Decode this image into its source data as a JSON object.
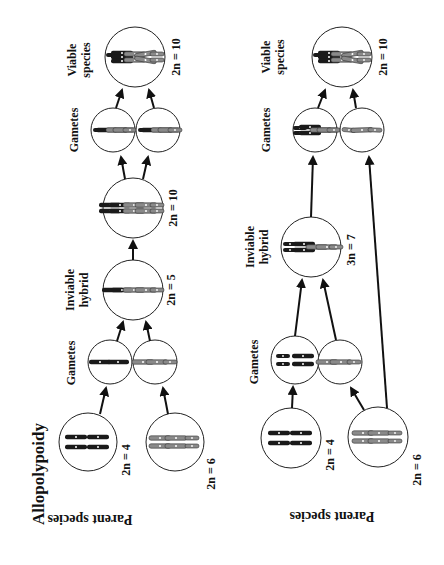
{
  "title": "Allopolypoidy",
  "colors": {
    "ink": "#111111",
    "species_a": "#1a1a1a",
    "species_b": "#8a8a8a",
    "background": "#ffffff"
  },
  "top_panel": {
    "parent_label": "Parent species",
    "parent_a": {
      "count": "2n = 4",
      "chromosome_color": "dark"
    },
    "parent_b": {
      "count": "2n = 6",
      "chromosome_color": "gray"
    },
    "gametes_label": "Gametes",
    "hybrid_label_1": "Inviable",
    "hybrid_label_2": "hybrid",
    "hybrid_count": "2n = 5",
    "doubled_count": "2n = 10",
    "gametes2_label": "Gametes",
    "viable_label_1": "Viable",
    "viable_label_2": "species",
    "viable_count": "2n = 10"
  },
  "bottom_panel": {
    "parent_label": "Parent species",
    "parent_a": {
      "count": "2n = 4",
      "chromosome_color": "dark"
    },
    "parent_b": {
      "count": "2n = 6",
      "chromosome_color": "gray"
    },
    "gametes_label": "Gametes",
    "hybrid_label_1": "Inviable",
    "hybrid_label_2": "hybrid",
    "hybrid_count": "3n = 7",
    "gametes2_label": "Gametes",
    "viable_label_1": "Viable",
    "viable_label_2": "species",
    "viable_count": "2n = 10"
  }
}
